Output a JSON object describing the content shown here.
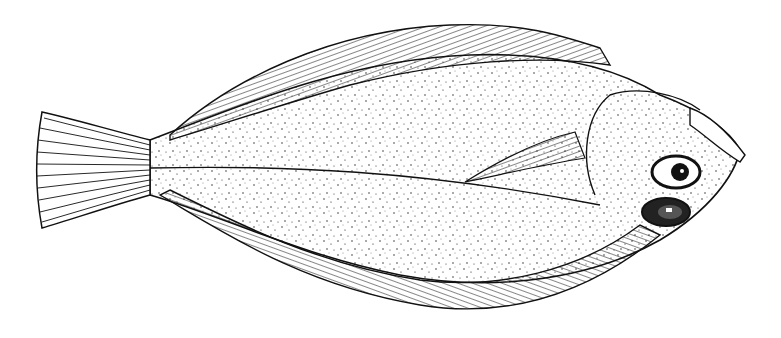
{
  "image": {
    "subject": "flatfish illustration",
    "style": "black ink stipple drawing on white",
    "colors": {
      "ink": "#111111",
      "background": "#ffffff",
      "fin_shade": "#333333"
    }
  }
}
